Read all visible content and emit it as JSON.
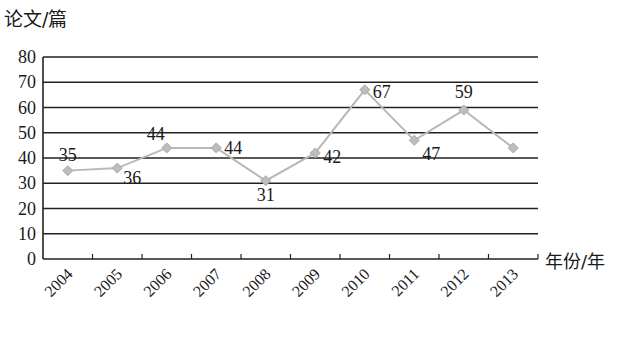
{
  "chart_data": {
    "type": "line",
    "title": "",
    "xlabel": "年份/年",
    "ylabel": "论文/篇",
    "categories": [
      "2004",
      "2005",
      "2006",
      "2007",
      "2008",
      "2009",
      "2010",
      "2011",
      "2012",
      "2013"
    ],
    "series": [
      {
        "name": "论文数量",
        "values": [
          35,
          36,
          44,
          44,
          31,
          42,
          67,
          47,
          59,
          44
        ],
        "color": "#b8b8b8",
        "marker": "diamond"
      }
    ],
    "data_labels": [
      "35",
      "36",
      "44",
      "44",
      "31",
      "42",
      "67",
      "47",
      "59",
      ""
    ],
    "yticks": [
      0,
      10,
      20,
      30,
      40,
      50,
      60,
      70,
      80
    ],
    "ylim": [
      0,
      80
    ],
    "grid": true,
    "legend": "none"
  }
}
